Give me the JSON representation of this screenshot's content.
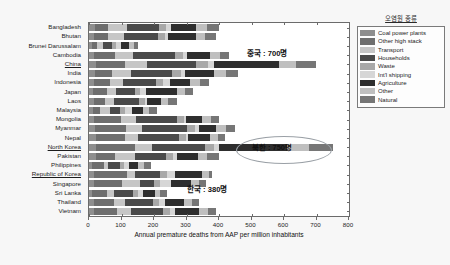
{
  "chart_data": {
    "type": "bar",
    "orientation": "horizontal",
    "stacked": true,
    "title": "",
    "xlabel": "Annual premature deaths from AAP per million inhabitants",
    "ylabel": "",
    "xlim": [
      0,
      800
    ],
    "xticks": [
      0,
      100,
      200,
      300,
      400,
      500,
      600,
      700,
      800
    ],
    "grid": false,
    "legend_position": "right-outside",
    "legend_title": "오염원 종류",
    "categories": [
      "Bangladesh",
      "Bhutan",
      "Brunei Darussalam",
      "Cambodia",
      "China",
      "India",
      "Indonesia",
      "Japan",
      "Laos",
      "Malaysia",
      "Mongolia",
      "Myanmar",
      "Nepal",
      "North Korea",
      "Pakistan",
      "Philippines",
      "Republic of Korea",
      "Singapore",
      "Sri Lanka",
      "Thailand",
      "Vietnam"
    ],
    "series": [
      {
        "name": "Coal power plants",
        "color": "#8e8e8e",
        "values": [
          18,
          14,
          10,
          16,
          22,
          18,
          14,
          12,
          14,
          12,
          14,
          18,
          20,
          22,
          20,
          10,
          16,
          14,
          10,
          14,
          16
        ]
      },
      {
        "name": "Other high stack",
        "color": "#6e6e6e",
        "values": [
          42,
          46,
          14,
          64,
          88,
          54,
          50,
          44,
          34,
          22,
          86,
          96,
          92,
          120,
          60,
          36,
          100,
          88,
          44,
          62,
          70
        ]
      },
      {
        "name": "Transport",
        "color": "#c6c6c6",
        "values": [
          56,
          48,
          18,
          54,
          70,
          56,
          40,
          28,
          30,
          30,
          44,
          48,
          40,
          52,
          60,
          14,
          26,
          54,
          22,
          36,
          44
        ]
      },
      {
        "name": "Households",
        "color": "#4a4a4a",
        "values": [
          98,
          104,
          30,
          132,
          150,
          128,
          102,
          58,
          76,
          32,
          128,
          140,
          124,
          164,
          96,
          36,
          78,
          44,
          60,
          84,
          98
        ]
      },
      {
        "name": "Waste",
        "color": "#a8a8a8",
        "values": [
          24,
          22,
          10,
          24,
          36,
          26,
          22,
          14,
          18,
          16,
          20,
          24,
          22,
          28,
          24,
          12,
          20,
          18,
          14,
          20,
          22
        ]
      },
      {
        "name": "Int'l shipping",
        "color": "#d6d6d6",
        "values": [
          14,
          10,
          18,
          12,
          18,
          14,
          20,
          18,
          8,
          20,
          8,
          12,
          8,
          14,
          12,
          16,
          24,
          34,
          16,
          18,
          16
        ]
      },
      {
        "name": "Agriculture",
        "color": "#2e2e2e",
        "values": [
          78,
          84,
          24,
          70,
          200,
          90,
          64,
          96,
          42,
          34,
          48,
          54,
          66,
          210,
          62,
          28,
          84,
          62,
          36,
          58,
          72
        ]
      },
      {
        "name": "Other",
        "color": "#bfbfbf",
        "values": [
          34,
          30,
          14,
          30,
          54,
          36,
          30,
          26,
          22,
          20,
          26,
          30,
          26,
          66,
          28,
          16,
          22,
          26,
          18,
          24,
          28
        ]
      },
      {
        "name": "Natural",
        "color": "#767676",
        "values": [
          36,
          32,
          12,
          28,
          62,
          38,
          28,
          24,
          26,
          24,
          26,
          28,
          22,
          74,
          38,
          22,
          10,
          20,
          20,
          24,
          24
        ]
      }
    ],
    "highlighted_categories": [
      "China",
      "North Korea",
      "Republic of Korea"
    ],
    "annotations": [
      {
        "id": "china",
        "text": "중국 : 700명",
        "category": "China",
        "value": 700
      },
      {
        "id": "north-korea",
        "text": "북한 : 750명",
        "category": "North Korea",
        "value": 750,
        "shape": "ellipse"
      },
      {
        "id": "south-korea",
        "text": "한국 : 380명",
        "category": "Republic of Korea",
        "value": 380
      }
    ]
  }
}
